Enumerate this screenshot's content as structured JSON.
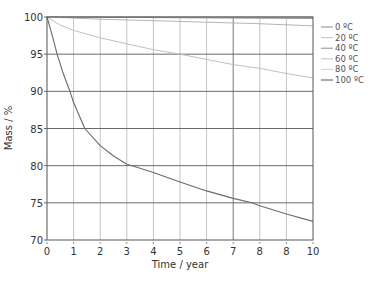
{
  "chart_data": {
    "type": "line",
    "title": "",
    "xlabel": "Time / year",
    "ylabel": "Mass / %",
    "xlim": [
      0,
      10
    ],
    "ylim": [
      70,
      100
    ],
    "x_ticks": [
      0,
      1,
      2,
      3,
      4,
      5,
      6,
      7,
      8,
      9,
      10
    ],
    "x_tick_labels": [
      "0",
      "1",
      "2",
      "3",
      "4",
      "5",
      "6",
      "7",
      "8",
      "8",
      "10"
    ],
    "y_ticks": [
      70,
      75,
      80,
      85,
      90,
      95,
      100
    ],
    "y_tick_labels": [
      "70",
      "75",
      "80",
      "85",
      "90",
      "95",
      "100"
    ],
    "grid": true,
    "legend_position": "right",
    "series": [
      {
        "name": "0 ºC",
        "color": "#8a8a8a",
        "x": [
          0,
          10
        ],
        "y": [
          100,
          100
        ]
      },
      {
        "name": "20 ºC",
        "color": "#b8b8b8",
        "x": [
          0,
          10
        ],
        "y": [
          100,
          99.9
        ]
      },
      {
        "name": "40 ºC",
        "color": "#9a9a9a",
        "x": [
          0,
          10
        ],
        "y": [
          100,
          99.8
        ]
      },
      {
        "name": "60 ºC",
        "color": "#b5b5b5",
        "x": [
          0,
          2,
          4,
          6,
          8,
          10
        ],
        "y": [
          100,
          99.7,
          99.5,
          99.3,
          99.1,
          98.8
        ]
      },
      {
        "name": "80 ºC",
        "color": "#c0c0c0",
        "x": [
          0,
          0.5,
          1,
          2,
          3,
          4,
          5,
          6,
          7,
          8,
          9,
          10
        ],
        "y": [
          100,
          98.9,
          98.2,
          97.2,
          96.4,
          95.6,
          95.0,
          94.3,
          93.6,
          93.1,
          92.4,
          91.8
        ]
      },
      {
        "name": "100 ºC",
        "color": "#6a6a6a",
        "x": [
          0,
          0.2,
          0.38,
          0.6,
          0.86,
          1,
          1.42,
          2,
          2.5,
          3,
          3.2,
          4,
          5,
          6,
          7,
          7.7,
          8,
          9,
          10
        ],
        "y": [
          100,
          97.5,
          95,
          92.5,
          90,
          88.5,
          85,
          82.7,
          81.3,
          80.2,
          80,
          79.1,
          77.8,
          76.6,
          75.6,
          75,
          74.6,
          73.5,
          72.5
        ]
      }
    ]
  }
}
